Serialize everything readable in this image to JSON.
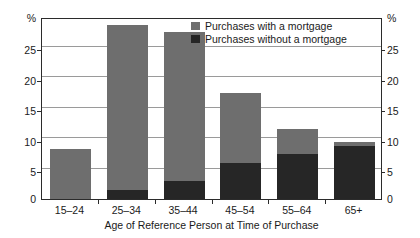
{
  "chart_data": {
    "type": "bar",
    "title": "",
    "subtitle": "",
    "xlabel": "Age of Reference Person at Time of Purchase",
    "ylabel": "%",
    "ylabel_right": "%",
    "categories": [
      "15–24",
      "25–34",
      "35–44",
      "45–54",
      "55–64",
      "65+"
    ],
    "series": [
      {
        "name": "Purchases with a mortgage",
        "color": "#6e6e6e",
        "values": [
          8.2,
          27.1,
          24.5,
          11.6,
          4.1,
          0.6
        ]
      },
      {
        "name": "Purchases without a mortgage",
        "color": "#262626",
        "values": [
          0.0,
          1.5,
          3.0,
          5.9,
          7.4,
          8.7
        ]
      }
    ],
    "totals": [
      8.2,
      28.6,
      27.5,
      17.5,
      11.5,
      9.3
    ],
    "stacked": true,
    "ylim": [
      0,
      29.9
    ],
    "yticks": [
      0,
      5,
      10,
      15,
      20,
      25
    ],
    "ytick_labels": [
      "0",
      "5",
      "10",
      "15",
      "20",
      "25"
    ],
    "grid": true,
    "grid_axis": "y",
    "legend_position": "top-right-inside",
    "axis_top_symbol": "%"
  },
  "legend": {
    "items": [
      {
        "label": "Purchases with a mortgage",
        "swatch": "#6e6e6e"
      },
      {
        "label": "Purchases without a mortgage",
        "swatch": "#262626"
      }
    ]
  },
  "axes": {
    "left_unit": "%",
    "right_unit": "%",
    "x_title": "Age of Reference Person at Time of Purchase"
  }
}
